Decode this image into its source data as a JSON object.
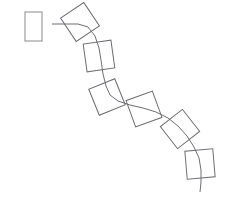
{
  "document": {
    "title": "Geometric Sweep Diagram",
    "width": 227,
    "height": 203,
    "background_color": "#ffffff"
  },
  "style": {
    "stroke_color": "#6e6e72",
    "stroke_color_light": "#8a8a8e",
    "stroke_width": 1,
    "fill": "none"
  },
  "chart_data": {
    "type": "diagram",
    "title": "",
    "xlabel": "",
    "ylabel": "",
    "xlim": [
      0,
      227
    ],
    "ylim": [
      0,
      203
    ],
    "grid": false,
    "legend": null,
    "elements": [
      {
        "name": "source-profile-rectangle",
        "kind": "rectangle",
        "cx": 33.5,
        "cy": 26.5,
        "width": 17,
        "height": 29,
        "rotation_deg": 0
      },
      {
        "name": "sweep-path",
        "kind": "polyline-spline",
        "points": [
          [
            52,
            24
          ],
          [
            78,
            24
          ],
          [
            88,
            27
          ],
          [
            95,
            36
          ],
          [
            99,
            48
          ],
          [
            101,
            60
          ],
          [
            103,
            74
          ],
          [
            106,
            86
          ],
          [
            110,
            95
          ],
          [
            118,
            101
          ],
          [
            130,
            105
          ],
          [
            143,
            108
          ],
          [
            156,
            112
          ],
          [
            168,
            118
          ],
          [
            178,
            126
          ],
          [
            187,
            136
          ],
          [
            194,
            147
          ],
          [
            199,
            158
          ],
          [
            201,
            170
          ],
          [
            201,
            182
          ],
          [
            200,
            192
          ]
        ]
      },
      {
        "name": "profile-frame-1",
        "kind": "square",
        "cx": 80,
        "cy": 22,
        "size": 28,
        "rotation_deg": -34
      },
      {
        "name": "profile-frame-2",
        "kind": "square",
        "cx": 99,
        "cy": 56,
        "size": 28,
        "rotation_deg": -8
      },
      {
        "name": "profile-frame-3",
        "kind": "square",
        "cx": 107,
        "cy": 97,
        "size": 28,
        "rotation_deg": -22
      },
      {
        "name": "profile-frame-4",
        "kind": "square",
        "cx": 144,
        "cy": 109,
        "size": 28,
        "rotation_deg": -20
      },
      {
        "name": "profile-frame-5",
        "kind": "square",
        "cx": 180,
        "cy": 129,
        "size": 28,
        "rotation_deg": -38
      },
      {
        "name": "profile-frame-6",
        "kind": "square",
        "cx": 200,
        "cy": 164,
        "size": 28,
        "rotation_deg": -5
      }
    ]
  }
}
